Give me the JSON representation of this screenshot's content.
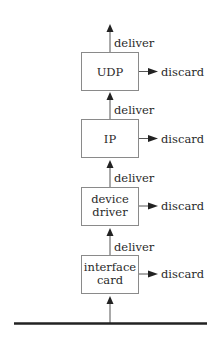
{
  "diagram": {
    "type": "protocol-stack-demultiplexing",
    "layers": [
      {
        "id": "udp",
        "lines": [
          "UDP"
        ],
        "discard_label": "discard",
        "deliver_label": "deliver"
      },
      {
        "id": "ip",
        "lines": [
          "IP"
        ],
        "discard_label": "discard",
        "deliver_label": "deliver"
      },
      {
        "id": "device-driver",
        "lines": [
          "device",
          "driver"
        ],
        "discard_label": "discard",
        "deliver_label": "deliver"
      },
      {
        "id": "interface-card",
        "lines": [
          "interface",
          "card"
        ],
        "discard_label": "discard",
        "deliver_label": "deliver"
      }
    ],
    "colors": {
      "box_border": "#8a8a8a",
      "line": "#555555",
      "arrowhead": "#222222",
      "text": "#2a2a2a",
      "baseline": "#222222"
    }
  }
}
